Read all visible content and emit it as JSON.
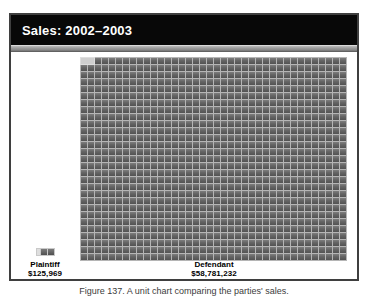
{
  "slide": {
    "title": "Sales: 2002–2003"
  },
  "chart_data": {
    "type": "bar",
    "variant": "unit-grid-pictograph",
    "title": "Sales: 2002–2003",
    "categories": [
      "Plaintiff",
      "Defendant"
    ],
    "values": [
      125969,
      58781232
    ],
    "value_labels": [
      "$125,969",
      "$58,781,232"
    ],
    "legend_position": "none",
    "grid_on": false,
    "unit_grid": {
      "columns": 38,
      "rows": 29,
      "plaintiff_units": 2,
      "highlight_units": 2
    },
    "colors": {
      "tile": "#5e5e5e",
      "tile_gap": "#b5b5b5",
      "highlight_patch": "#cfcfcf",
      "title_bar_bg": "#080808",
      "title_text": "#ffffff",
      "frame_border": "#3f3f3f",
      "accent_strip": "#9c9c9c"
    }
  },
  "labels": {
    "plaintiff_name": "Plaintiff",
    "plaintiff_value": "$125,969",
    "defendant_name": "Defendant",
    "defendant_value": "$58,781,232"
  },
  "caption": "Figure 137. A unit chart comparing the parties' sales."
}
